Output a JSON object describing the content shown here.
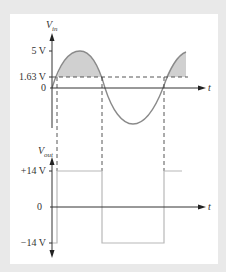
{
  "top_panel": {
    "y_label": "V",
    "y_label_sub": "in",
    "x_label": "t",
    "ticks": [
      {
        "label": "5 V",
        "value": 5
      },
      {
        "label": "1.63 V",
        "value": 1.63
      },
      {
        "label": "0",
        "value": 0
      }
    ]
  },
  "bottom_panel": {
    "y_label": "V",
    "y_label_sub": "out",
    "x_label": "t",
    "ticks": [
      {
        "label": "+14 V",
        "value": 14
      },
      {
        "label": "0",
        "value": 0
      },
      {
        "label": "−14 V",
        "value": -14
      }
    ]
  },
  "colors": {
    "axis": "#333333",
    "waveform": "#8a8a8a",
    "fill": "#d0d0d0",
    "square": "#b8b8b8",
    "dashed": "#444444"
  }
}
